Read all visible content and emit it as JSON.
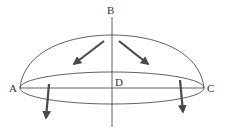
{
  "diagram": {
    "type": "hemisphere-dome-with-force-arrows",
    "labels": {
      "top": "B",
      "left": "A",
      "right": "C",
      "center": "D"
    },
    "colors": {
      "line": "#3a3a3a",
      "arrow": "#4a4a4a",
      "text": "#333333",
      "background": "#ffffff"
    },
    "arrows": [
      {
        "name": "upper-left",
        "from": [
          104,
          41
        ],
        "to": [
          74,
          64
        ]
      },
      {
        "name": "upper-right",
        "from": [
          119,
          41
        ],
        "to": [
          148,
          64
        ]
      },
      {
        "name": "lower-left",
        "from": [
          49,
          84
        ],
        "to": [
          46,
          118
        ]
      },
      {
        "name": "lower-right",
        "from": [
          180,
          80
        ],
        "to": [
          183,
          112
        ]
      }
    ]
  }
}
